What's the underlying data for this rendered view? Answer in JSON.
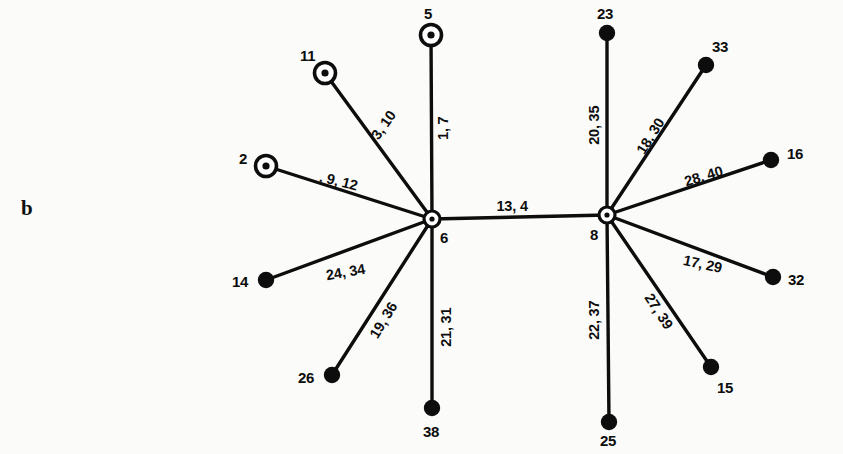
{
  "figure": {
    "panel_letter": "b",
    "width": 843,
    "height": 454,
    "background_color": "#fbfbf9",
    "ink_color": "#0d0d0d"
  },
  "chart_data": {
    "type": "diagram",
    "diagram_kind": "node-link-graph",
    "title": "",
    "nodes": [
      {
        "id": "5",
        "label": "5",
        "x": 431,
        "y": 35,
        "style": "ring-dot",
        "label_x": 424,
        "label_y": 6
      },
      {
        "id": "11",
        "label": "11",
        "x": 325,
        "y": 73,
        "style": "ring-dot",
        "label_x": 300,
        "label_y": 48
      },
      {
        "id": "2",
        "label": "2",
        "x": 266,
        "y": 166,
        "style": "ring-dot",
        "label_x": 239,
        "label_y": 151
      },
      {
        "id": "6",
        "label": "6",
        "x": 432,
        "y": 219,
        "style": "ring-dot",
        "label_x": 440,
        "label_y": 230
      },
      {
        "id": "8",
        "label": "8",
        "x": 607,
        "y": 215,
        "style": "ring-dot",
        "label_x": 590,
        "label_y": 227
      },
      {
        "id": "14",
        "label": "14",
        "x": 266,
        "y": 280,
        "style": "filled",
        "label_x": 232,
        "label_y": 274
      },
      {
        "id": "26",
        "label": "26",
        "x": 332,
        "y": 375,
        "style": "filled",
        "label_x": 298,
        "label_y": 370
      },
      {
        "id": "38",
        "label": "38",
        "x": 432,
        "y": 408,
        "style": "filled",
        "label_x": 423,
        "label_y": 424
      },
      {
        "id": "23",
        "label": "23",
        "x": 607,
        "y": 33,
        "style": "filled",
        "label_x": 597,
        "label_y": 6
      },
      {
        "id": "33",
        "label": "33",
        "x": 706,
        "y": 65,
        "style": "filled",
        "label_x": 712,
        "label_y": 39
      },
      {
        "id": "16",
        "label": "16",
        "x": 771,
        "y": 160,
        "style": "filled",
        "label_x": 787,
        "label_y": 146
      },
      {
        "id": "32",
        "label": "32",
        "x": 773,
        "y": 277,
        "style": "filled",
        "label_x": 788,
        "label_y": 272
      },
      {
        "id": "15",
        "label": "15",
        "x": 711,
        "y": 367,
        "style": "filled",
        "label_x": 717,
        "label_y": 380
      },
      {
        "id": "25",
        "label": "25",
        "x": 609,
        "y": 422,
        "style": "filled",
        "label_x": 600,
        "label_y": 433
      }
    ],
    "edges": [
      {
        "source": "6",
        "target": "5",
        "label": "1, 7",
        "label_x": 443,
        "label_y": 128,
        "label_rotation": -90
      },
      {
        "source": "6",
        "target": "11",
        "label": "3, 10",
        "label_x": 383,
        "label_y": 125,
        "label_rotation": -55
      },
      {
        "source": "6",
        "target": "2",
        "label": ". 9, 12",
        "label_x": 338,
        "label_y": 181,
        "label_rotation": 14
      },
      {
        "source": "6",
        "target": "14",
        "label": "24, 34",
        "label_x": 345,
        "label_y": 272,
        "label_rotation": -10
      },
      {
        "source": "6",
        "target": "26",
        "label": "19, 36",
        "label_x": 383,
        "label_y": 320,
        "label_rotation": -59
      },
      {
        "source": "6",
        "target": "38",
        "label": "21, 31",
        "label_x": 446,
        "label_y": 327,
        "label_rotation": -90
      },
      {
        "source": "6",
        "target": "8",
        "label": "13, 4",
        "label_x": 512,
        "label_y": 206,
        "label_rotation": 0
      },
      {
        "source": "8",
        "target": "23",
        "label": "20, 35",
        "label_x": 594,
        "label_y": 125,
        "label_rotation": -90
      },
      {
        "source": "8",
        "target": "33",
        "label": "18, 30",
        "label_x": 650,
        "label_y": 136,
        "label_rotation": -58
      },
      {
        "source": "8",
        "target": "16",
        "label": "28, 40",
        "label_x": 703,
        "label_y": 176,
        "label_rotation": -17
      },
      {
        "source": "8",
        "target": "32",
        "label": "17, 29",
        "label_x": 702,
        "label_y": 264,
        "label_rotation": 12
      },
      {
        "source": "8",
        "target": "15",
        "label": "27, 39",
        "label_x": 658,
        "label_y": 311,
        "label_rotation": 57
      },
      {
        "source": "8",
        "target": "25",
        "label": "22, 37",
        "label_x": 594,
        "label_y": 320,
        "label_rotation": -90
      }
    ]
  }
}
